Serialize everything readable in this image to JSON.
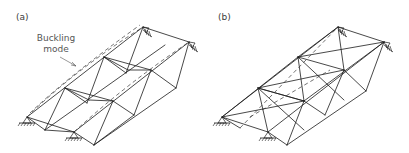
{
  "panels": [
    {
      "id": "a",
      "label": "(a)",
      "annotation": {
        "line1": "Buckling",
        "line2": "mode"
      },
      "description": "Space truss with buckling mode shown as dashed lines along top chords"
    },
    {
      "id": "b",
      "label": "(b)",
      "description": "Space truss with additional diagonal X-bracing; dashed hidden members"
    }
  ],
  "colors": {
    "member": "#1a1a1a",
    "dashed": "#333333",
    "text": "#3a3a3a"
  }
}
